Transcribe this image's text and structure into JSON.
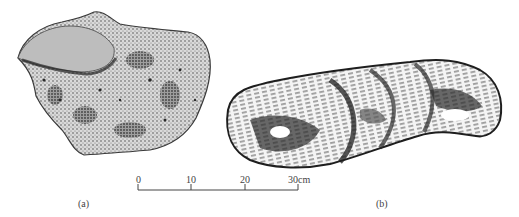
{
  "figure": {
    "panels": [
      {
        "id": "a",
        "caption": "(a)",
        "description": "stippled drawing of an irregular lumpy rounded artifact/stone"
      },
      {
        "id": "b",
        "caption": "(b)",
        "description": "drawing of an elongated twisted rope-like artifact"
      }
    ],
    "scale_bar": {
      "ticks": [
        "0",
        "10",
        "20",
        "30cm"
      ],
      "unit": "cm"
    },
    "colors": {
      "ink": "#3a3a3a",
      "dark": "#1e1e1e",
      "mid": "#7a7a7a",
      "light": "#cfcfcf",
      "paper": "#ffffff"
    }
  }
}
